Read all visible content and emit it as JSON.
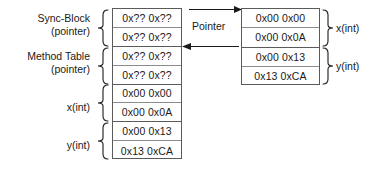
{
  "diagram": {
    "colors": {
      "background": "#ffffff",
      "cell_border": "#8c8c8c",
      "table_border": "#5a5a5a",
      "text": "#1a1a1a",
      "arrow": "#1a1a1a"
    },
    "left_table": {
      "name": "referencing-object-memory-block",
      "cells": [
        {
          "value": "0x?? 0x??"
        },
        {
          "value": "0x?? 0x??"
        },
        {
          "value": "0x?? 0x??"
        },
        {
          "value": "0x?? 0x??"
        },
        {
          "value": "0x00 0x00"
        },
        {
          "value": "0x00 0x0A"
        },
        {
          "value": "0x00 0x13"
        },
        {
          "value": "0x13 0xCA"
        }
      ],
      "groups": [
        {
          "label_line1": "Sync-Block",
          "label_line2": "(pointer)"
        },
        {
          "label_line1": "Method Table",
          "label_line2": "(pointer)"
        },
        {
          "label_line1": "x(int)",
          "label_line2": ""
        },
        {
          "label_line1": "y(int)",
          "label_line2": ""
        }
      ]
    },
    "right_table": {
      "name": "referenced-object-memory-block",
      "cells": [
        {
          "value": "0x00 0x00"
        },
        {
          "value": "0x00 0x0A"
        },
        {
          "value": "0x00 0x13"
        },
        {
          "value": "0x13 0xCA"
        }
      ],
      "groups": [
        {
          "label": "x(int)"
        },
        {
          "label": "y(int)"
        }
      ]
    },
    "pointer_label": "Pointer"
  }
}
